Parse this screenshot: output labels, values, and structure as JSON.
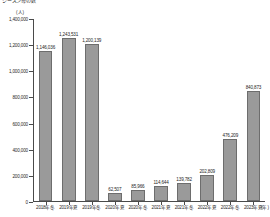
{
  "caption": "シーズン毎の数",
  "chart_data": {
    "type": "bar",
    "title": "",
    "subtitle": "",
    "unit_label": "(人)",
    "xlabel": "(年)",
    "ylabel": "",
    "ylim": [
      0,
      1400000
    ],
    "grid": false,
    "legend": "none",
    "categories": [
      "2018年冬",
      "2019年夏",
      "2019年冬",
      "2020年夏",
      "2020年冬",
      "2021年夏",
      "2021年冬",
      "2022年夏",
      "2022年冬",
      "2023年夏"
    ],
    "values": [
      1146036,
      1243531,
      1200139,
      62507,
      85966,
      114644,
      139782,
      202809,
      476209,
      840873
    ],
    "value_labels": [
      "1,146,036",
      "1,243,531",
      "1,200,139",
      "62,507",
      "85,966",
      "114,644",
      "139,782",
      "202,809",
      "476,209",
      "840,873"
    ],
    "ytick_values": [
      0,
      200000,
      400000,
      600000,
      800000,
      1000000,
      1200000,
      1400000
    ],
    "ytick_labels": [
      "0",
      "200,000",
      "400,000",
      "600,000",
      "800,000",
      "1,000,000",
      "1,200,000",
      "1,400,000"
    ],
    "bar_color": "#9a9a9a",
    "bar_border_color": "#6d6d6d",
    "axis_color": "#4a4a4a",
    "text_color": "#1f1f1f"
  }
}
